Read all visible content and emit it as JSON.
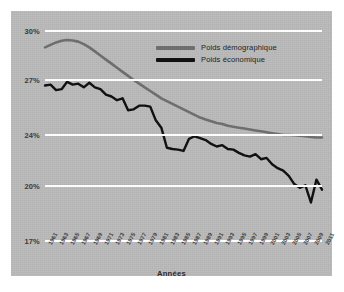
{
  "chart_data": {
    "type": "line",
    "title": "",
    "subtitle": "",
    "xlabel": "Années",
    "ylabel": "",
    "grid": true,
    "legend_position": "top-right-inside",
    "ylim": [
      17,
      30
    ],
    "ytick_labels": [
      "30%",
      "27%",
      "24%",
      "20%",
      "17%"
    ],
    "ytick_values": [
      30,
      27,
      24,
      20,
      17
    ],
    "xtick_labels": [
      "1961",
      "1963",
      "1965",
      "1967",
      "1969",
      "1971",
      "1973",
      "1975",
      "1977",
      "1979",
      "1981",
      "1983",
      "1985",
      "1987",
      "1989",
      "1991",
      "1993",
      "1995",
      "1997",
      "1999",
      "2001",
      "2003",
      "2005",
      "2007",
      "2009",
      "2011"
    ],
    "x": [
      1961,
      1962,
      1963,
      1964,
      1965,
      1966,
      1967,
      1968,
      1969,
      1970,
      1971,
      1972,
      1973,
      1974,
      1975,
      1976,
      1977,
      1978,
      1979,
      1980,
      1981,
      1982,
      1983,
      1984,
      1985,
      1986,
      1987,
      1988,
      1989,
      1990,
      1991,
      1992,
      1993,
      1994,
      1995,
      1996,
      1997,
      1998,
      1999,
      2000,
      2001,
      2002,
      2003,
      2004,
      2005,
      2006,
      2007,
      2008,
      2009,
      2010,
      2011
    ],
    "series": [
      {
        "name": "Poids démographique",
        "color": "#6e6e6e",
        "values": [
          29.0,
          29.15,
          29.3,
          29.4,
          29.45,
          29.42,
          29.35,
          29.2,
          29.0,
          28.75,
          28.5,
          28.25,
          28.0,
          27.75,
          27.5,
          27.25,
          27.0,
          26.8,
          26.6,
          26.4,
          26.2,
          26.0,
          25.85,
          25.7,
          25.55,
          25.4,
          25.25,
          25.1,
          24.95,
          24.85,
          24.75,
          24.65,
          24.6,
          24.5,
          24.45,
          24.4,
          24.35,
          24.3,
          24.25,
          24.2,
          24.15,
          24.1,
          24.05,
          24.0,
          24.0,
          23.98,
          23.95,
          23.9,
          23.85,
          23.8,
          23.8
        ]
      },
      {
        "name": "Poids économique",
        "color": "#111111",
        "values": [
          26.7,
          26.75,
          26.45,
          26.5,
          26.9,
          26.75,
          26.8,
          26.6,
          26.85,
          26.6,
          26.5,
          26.2,
          26.1,
          25.9,
          26.0,
          25.35,
          25.4,
          25.6,
          25.6,
          25.55,
          24.8,
          24.4,
          23.0,
          22.9,
          22.85,
          22.75,
          23.7,
          23.9,
          23.75,
          23.6,
          23.3,
          23.1,
          23.2,
          22.9,
          22.85,
          22.6,
          22.4,
          22.3,
          22.5,
          22.1,
          22.2,
          21.7,
          21.4,
          21.2,
          20.8,
          20.15,
          19.9,
          20.05,
          19.1,
          20.5,
          19.8
        ]
      }
    ]
  },
  "legend": {
    "items": [
      {
        "label": "Poids démographique",
        "color": "#6e6e6e"
      },
      {
        "label": "Poids économique",
        "color": "#111111"
      }
    ]
  },
  "axis": {
    "x_title": "Années"
  }
}
